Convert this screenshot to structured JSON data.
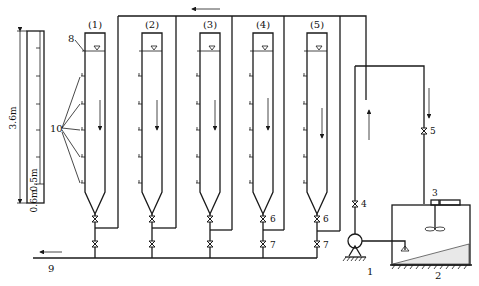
{
  "diagram": {
    "type": "settling-column apparatus schematic",
    "columns": [
      {
        "label": "(1)",
        "x": 85
      },
      {
        "label": "(2)",
        "x": 142
      },
      {
        "label": "(3)",
        "x": 200
      },
      {
        "label": "(4)",
        "x": 253
      },
      {
        "label": "(5)",
        "x": 307
      }
    ],
    "scale_bar": {
      "total_height": "3.6m",
      "spacing": "0.5m",
      "bottom_offset": "0.6m"
    },
    "component_labels": {
      "pump": "1",
      "tank": "2",
      "stirrer": "3",
      "valve_pump": "4",
      "valve_tank": "5",
      "valve_upper": "6",
      "valve_lower": "7",
      "water_level": "8",
      "outlet": "9",
      "sampling_ports": "10"
    }
  }
}
